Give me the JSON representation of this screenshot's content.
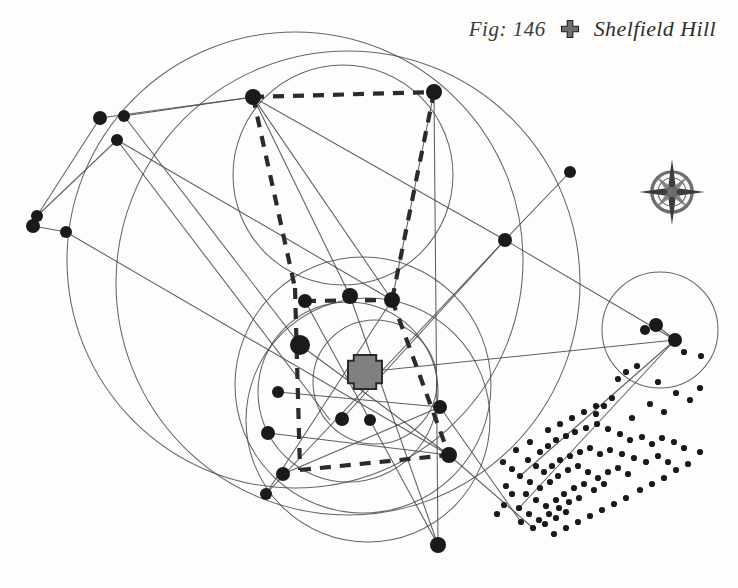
{
  "figure": {
    "number_label": "Fig: 146",
    "site_name": "Shelfield Hill",
    "marker_icon": "cross-marker-icon",
    "compass_icon": "compass-rose-icon",
    "background_color": "#fdfdfc",
    "line_color": "#4a4a4a",
    "node_color": "#1a1a1a",
    "dashed_color": "#2b2b2b",
    "marker_fill": "#808080",
    "marker_stroke": "#2b2b2b",
    "compass_color": "#6e6e6e"
  },
  "chart_data": {
    "type": "scatter",
    "title": "Fig: 146  Shelfield Hill",
    "xlabel": "",
    "ylabel": "",
    "xlim": [
      0,
      738
    ],
    "ylim": [
      0,
      588
    ],
    "grid": false,
    "legend": {
      "position": "top-right",
      "entries": [
        {
          "label": "Shelfield Hill",
          "symbol": "cross",
          "color": "#808080"
        }
      ]
    },
    "annotations": [
      {
        "text": "Fig: 146",
        "x": 470,
        "y": 38
      },
      {
        "text": "Shelfield Hill",
        "x": 560,
        "y": 38
      }
    ],
    "site_marker": {
      "name": "Shelfield Hill",
      "x": 365,
      "y": 372,
      "symbol": "cross",
      "size": 34
    },
    "compass_rose": {
      "x": 672,
      "y": 192,
      "r": 28
    },
    "circles": [
      {
        "cx": 295,
        "cy": 260,
        "r": 228
      },
      {
        "cx": 348,
        "cy": 283,
        "r": 232
      },
      {
        "cx": 343,
        "cy": 175,
        "r": 110
      },
      {
        "cx": 363,
        "cy": 385,
        "r": 128
      },
      {
        "cx": 348,
        "cy": 392,
        "r": 90
      },
      {
        "cx": 375,
        "cy": 382,
        "r": 62
      },
      {
        "cx": 660,
        "cy": 330,
        "r": 58
      },
      {
        "cx": 368,
        "cy": 420,
        "r": 122
      }
    ],
    "nodes": [
      {
        "id": "n1",
        "x": 100,
        "y": 118,
        "r": 7
      },
      {
        "id": "n2",
        "x": 124,
        "y": 116,
        "r": 6
      },
      {
        "id": "n3",
        "x": 117,
        "y": 140,
        "r": 6
      },
      {
        "id": "n4",
        "x": 37,
        "y": 216,
        "r": 6
      },
      {
        "id": "n5",
        "x": 33,
        "y": 226,
        "r": 7
      },
      {
        "id": "n6",
        "x": 66,
        "y": 232,
        "r": 6
      },
      {
        "id": "n7",
        "x": 253,
        "y": 97,
        "r": 8
      },
      {
        "id": "n8",
        "x": 434,
        "y": 92,
        "r": 8
      },
      {
        "id": "n9",
        "x": 505,
        "y": 240,
        "r": 7
      },
      {
        "id": "n10",
        "x": 570,
        "y": 172,
        "r": 6
      },
      {
        "id": "n11",
        "x": 392,
        "y": 300,
        "r": 8
      },
      {
        "id": "n12",
        "x": 350,
        "y": 296,
        "r": 8
      },
      {
        "id": "n13",
        "x": 305,
        "y": 301,
        "r": 7
      },
      {
        "id": "n14",
        "x": 300,
        "y": 345,
        "r": 10
      },
      {
        "id": "n15",
        "x": 278,
        "y": 392,
        "r": 6
      },
      {
        "id": "n16",
        "x": 268,
        "y": 433,
        "r": 7
      },
      {
        "id": "n17",
        "x": 283,
        "y": 474,
        "r": 7
      },
      {
        "id": "n18",
        "x": 266,
        "y": 494,
        "r": 6
      },
      {
        "id": "n19",
        "x": 342,
        "y": 419,
        "r": 7
      },
      {
        "id": "n20",
        "x": 370,
        "y": 420,
        "r": 6
      },
      {
        "id": "n21",
        "x": 440,
        "y": 407,
        "r": 7
      },
      {
        "id": "n22",
        "x": 449,
        "y": 455,
        "r": 8
      },
      {
        "id": "n23",
        "x": 438,
        "y": 545,
        "r": 8
      },
      {
        "id": "n24",
        "x": 656,
        "y": 325,
        "r": 7
      },
      {
        "id": "n25",
        "x": 675,
        "y": 340,
        "r": 7
      },
      {
        "id": "n26",
        "x": 645,
        "y": 330,
        "r": 5
      }
    ],
    "small_dots": [
      {
        "x": 684,
        "y": 352
      },
      {
        "x": 701,
        "y": 356
      },
      {
        "x": 637,
        "y": 366
      },
      {
        "x": 626,
        "y": 372
      },
      {
        "x": 618,
        "y": 379
      },
      {
        "x": 658,
        "y": 382
      },
      {
        "x": 676,
        "y": 393
      },
      {
        "x": 690,
        "y": 400
      },
      {
        "x": 700,
        "y": 388
      },
      {
        "x": 612,
        "y": 398
      },
      {
        "x": 604,
        "y": 406
      },
      {
        "x": 596,
        "y": 414
      },
      {
        "x": 650,
        "y": 404
      },
      {
        "x": 664,
        "y": 412
      },
      {
        "x": 632,
        "y": 418
      },
      {
        "x": 540,
        "y": 452
      },
      {
        "x": 548,
        "y": 446
      },
      {
        "x": 556,
        "y": 440
      },
      {
        "x": 566,
        "y": 436
      },
      {
        "x": 575,
        "y": 432
      },
      {
        "x": 586,
        "y": 428
      },
      {
        "x": 597,
        "y": 424
      },
      {
        "x": 608,
        "y": 429
      },
      {
        "x": 620,
        "y": 434
      },
      {
        "x": 630,
        "y": 440
      },
      {
        "x": 642,
        "y": 437
      },
      {
        "x": 652,
        "y": 444
      },
      {
        "x": 662,
        "y": 438
      },
      {
        "x": 674,
        "y": 442
      },
      {
        "x": 684,
        "y": 448
      },
      {
        "x": 528,
        "y": 460
      },
      {
        "x": 536,
        "y": 466
      },
      {
        "x": 544,
        "y": 472
      },
      {
        "x": 552,
        "y": 466
      },
      {
        "x": 560,
        "y": 460
      },
      {
        "x": 570,
        "y": 456
      },
      {
        "x": 580,
        "y": 452
      },
      {
        "x": 590,
        "y": 448
      },
      {
        "x": 600,
        "y": 454
      },
      {
        "x": 610,
        "y": 450
      },
      {
        "x": 622,
        "y": 454
      },
      {
        "x": 634,
        "y": 458
      },
      {
        "x": 646,
        "y": 462
      },
      {
        "x": 658,
        "y": 456
      },
      {
        "x": 668,
        "y": 462
      },
      {
        "x": 520,
        "y": 476
      },
      {
        "x": 530,
        "y": 482
      },
      {
        "x": 540,
        "y": 488
      },
      {
        "x": 550,
        "y": 482
      },
      {
        "x": 558,
        "y": 476
      },
      {
        "x": 568,
        "y": 470
      },
      {
        "x": 578,
        "y": 466
      },
      {
        "x": 588,
        "y": 472
      },
      {
        "x": 598,
        "y": 478
      },
      {
        "x": 608,
        "y": 472
      },
      {
        "x": 618,
        "y": 468
      },
      {
        "x": 628,
        "y": 474
      },
      {
        "x": 526,
        "y": 494
      },
      {
        "x": 536,
        "y": 500
      },
      {
        "x": 546,
        "y": 506
      },
      {
        "x": 556,
        "y": 500
      },
      {
        "x": 564,
        "y": 494
      },
      {
        "x": 574,
        "y": 488
      },
      {
        "x": 584,
        "y": 484
      },
      {
        "x": 594,
        "y": 490
      },
      {
        "x": 604,
        "y": 484
      },
      {
        "x": 519,
        "y": 508
      },
      {
        "x": 529,
        "y": 514
      },
      {
        "x": 539,
        "y": 520
      },
      {
        "x": 549,
        "y": 514
      },
      {
        "x": 559,
        "y": 508
      },
      {
        "x": 569,
        "y": 502
      },
      {
        "x": 579,
        "y": 498
      },
      {
        "x": 512,
        "y": 494
      },
      {
        "x": 506,
        "y": 486
      },
      {
        "x": 521,
        "y": 522
      },
      {
        "x": 533,
        "y": 528
      },
      {
        "x": 545,
        "y": 524
      },
      {
        "x": 556,
        "y": 518
      },
      {
        "x": 566,
        "y": 512
      },
      {
        "x": 504,
        "y": 505
      },
      {
        "x": 497,
        "y": 514
      },
      {
        "x": 512,
        "y": 469
      },
      {
        "x": 503,
        "y": 462
      },
      {
        "x": 548,
        "y": 430
      },
      {
        "x": 560,
        "y": 424
      },
      {
        "x": 572,
        "y": 418
      },
      {
        "x": 584,
        "y": 412
      },
      {
        "x": 596,
        "y": 406
      },
      {
        "x": 530,
        "y": 442
      },
      {
        "x": 516,
        "y": 450
      },
      {
        "x": 554,
        "y": 534
      },
      {
        "x": 566,
        "y": 528
      },
      {
        "x": 578,
        "y": 522
      },
      {
        "x": 590,
        "y": 516
      },
      {
        "x": 602,
        "y": 510
      },
      {
        "x": 614,
        "y": 504
      },
      {
        "x": 626,
        "y": 498
      },
      {
        "x": 640,
        "y": 490
      },
      {
        "x": 652,
        "y": 484
      },
      {
        "x": 664,
        "y": 478
      },
      {
        "x": 676,
        "y": 470
      },
      {
        "x": 688,
        "y": 464
      },
      {
        "x": 700,
        "y": 452
      }
    ],
    "lines": [
      {
        "x1": 100,
        "y1": 118,
        "x2": 253,
        "y2": 97
      },
      {
        "x1": 124,
        "y1": 116,
        "x2": 253,
        "y2": 97
      },
      {
        "x1": 124,
        "y1": 116,
        "x2": 300,
        "y2": 345
      },
      {
        "x1": 117,
        "y1": 140,
        "x2": 330,
        "y2": 420
      },
      {
        "x1": 100,
        "y1": 118,
        "x2": 37,
        "y2": 216
      },
      {
        "x1": 33,
        "y1": 226,
        "x2": 66,
        "y2": 232
      },
      {
        "x1": 66,
        "y1": 232,
        "x2": 449,
        "y2": 455
      },
      {
        "x1": 37,
        "y1": 216,
        "x2": 117,
        "y2": 140
      },
      {
        "x1": 253,
        "y1": 97,
        "x2": 392,
        "y2": 300
      },
      {
        "x1": 253,
        "y1": 97,
        "x2": 505,
        "y2": 240
      },
      {
        "x1": 253,
        "y1": 97,
        "x2": 350,
        "y2": 296
      },
      {
        "x1": 434,
        "y1": 92,
        "x2": 392,
        "y2": 300
      },
      {
        "x1": 434,
        "y1": 92,
        "x2": 438,
        "y2": 545
      },
      {
        "x1": 505,
        "y1": 240,
        "x2": 570,
        "y2": 172
      },
      {
        "x1": 505,
        "y1": 240,
        "x2": 675,
        "y2": 340
      },
      {
        "x1": 505,
        "y1": 240,
        "x2": 266,
        "y2": 494
      },
      {
        "x1": 365,
        "y1": 372,
        "x2": 675,
        "y2": 340
      },
      {
        "x1": 675,
        "y1": 340,
        "x2": 520,
        "y2": 476
      },
      {
        "x1": 675,
        "y1": 340,
        "x2": 519,
        "y2": 508
      },
      {
        "x1": 656,
        "y1": 325,
        "x2": 675,
        "y2": 340
      },
      {
        "x1": 300,
        "y1": 345,
        "x2": 449,
        "y2": 455
      },
      {
        "x1": 305,
        "y1": 301,
        "x2": 438,
        "y2": 545
      },
      {
        "x1": 278,
        "y1": 392,
        "x2": 440,
        "y2": 407
      },
      {
        "x1": 268,
        "y1": 433,
        "x2": 449,
        "y2": 455
      },
      {
        "x1": 283,
        "y1": 474,
        "x2": 440,
        "y2": 407
      },
      {
        "x1": 342,
        "y1": 419,
        "x2": 505,
        "y2": 240
      },
      {
        "x1": 449,
        "y1": 455,
        "x2": 533,
        "y2": 528
      },
      {
        "x1": 440,
        "y1": 407,
        "x2": 521,
        "y2": 522
      },
      {
        "x1": 266,
        "y1": 494,
        "x2": 392,
        "y2": 300
      },
      {
        "x1": 350,
        "y1": 296,
        "x2": 438,
        "y2": 545
      },
      {
        "x1": 117,
        "y1": 140,
        "x2": 392,
        "y2": 300
      }
    ],
    "dashed_lines": [
      {
        "x1": 253,
        "y1": 97,
        "x2": 434,
        "y2": 92
      },
      {
        "x1": 434,
        "y1": 92,
        "x2": 392,
        "y2": 300
      },
      {
        "x1": 253,
        "y1": 97,
        "x2": 295,
        "y2": 288
      },
      {
        "x1": 392,
        "y1": 300,
        "x2": 449,
        "y2": 455
      },
      {
        "x1": 295,
        "y1": 288,
        "x2": 300,
        "y2": 470
      },
      {
        "x1": 300,
        "y1": 470,
        "x2": 449,
        "y2": 455
      },
      {
        "x1": 305,
        "y1": 301,
        "x2": 392,
        "y2": 300
      }
    ]
  }
}
